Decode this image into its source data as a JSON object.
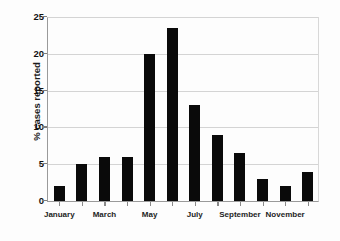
{
  "chart_data": {
    "type": "bar",
    "title": "",
    "xlabel": "",
    "ylabel": "% cases reported",
    "ylim": [
      0,
      25
    ],
    "yticks": [
      0,
      5,
      10,
      15,
      20,
      25
    ],
    "ytick_labels": [
      "0",
      "5",
      "10",
      "15",
      "20",
      "25"
    ],
    "grid": true,
    "legend": "none",
    "categories": [
      "January",
      "February",
      "March",
      "April",
      "May",
      "June",
      "July",
      "August",
      "September",
      "October",
      "November",
      "December"
    ],
    "visible_tick_labels": [
      "January",
      "March",
      "May",
      "July",
      "September",
      "November"
    ],
    "values": [
      2,
      5,
      6,
      6,
      20,
      23.5,
      13,
      9,
      6.5,
      3,
      2,
      4
    ],
    "bar_color": "#0a0a0a",
    "grid_color": "#d4d4d4",
    "axis_color": "#9a9a9a",
    "background_color": "#fdfdfd"
  }
}
